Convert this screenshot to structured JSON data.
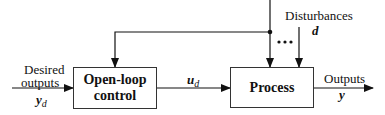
{
  "diagram": {
    "type": "block-diagram",
    "blocks": [
      {
        "id": "open-loop-control",
        "label_line1": "Open-loop",
        "label_line2": "control"
      },
      {
        "id": "process",
        "label": "Process"
      }
    ],
    "inputs": {
      "desired_outputs": {
        "line1": "Desired",
        "line2": "outputs",
        "symbol": "y",
        "subscript": "d"
      }
    },
    "signals": {
      "control_signal": {
        "symbol": "u",
        "subscript": "d"
      }
    },
    "disturbances": {
      "label": "Disturbances",
      "symbol": "d",
      "ellipsis": "•••"
    },
    "outputs": {
      "label": "Outputs",
      "symbol": "y"
    },
    "edges": [
      {
        "from": "desired_outputs",
        "to": "open-loop-control"
      },
      {
        "from": "open-loop-control",
        "to": "process",
        "label": "u_d"
      },
      {
        "from": "disturbances",
        "to": "process"
      },
      {
        "from": "disturbances",
        "to": "open-loop-control",
        "note": "feedforward branch"
      },
      {
        "from": "process",
        "to": "outputs"
      }
    ],
    "colors": {
      "line": "#111111",
      "box_border": "#333333",
      "background": "#ffffff"
    }
  }
}
